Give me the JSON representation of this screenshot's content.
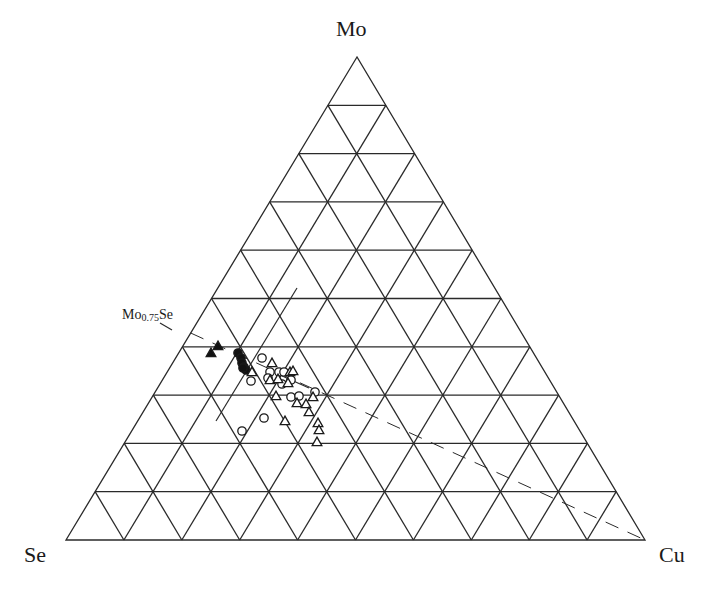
{
  "chart_data": {
    "type": "ternary-scatter",
    "title": "",
    "vertices": {
      "top": "Mo",
      "left": "Se",
      "right": "Cu"
    },
    "grid": {
      "divisions": 10,
      "on": true
    },
    "annotations": [
      {
        "label_main": "Mo",
        "label_sub": "0.75",
        "label_tail": "Se",
        "composition": {
          "Mo": 0.4286,
          "Se": 0.5714,
          "Cu": 0.0
        }
      }
    ],
    "lines": [
      {
        "style": "dashed",
        "from": "Mo0.75Se",
        "to": "Cu",
        "from_px": [
          190.7,
          333.0
        ],
        "to_px": [
          645,
          540
        ]
      },
      {
        "style": "solid",
        "from_px": [
          297,
          288
        ],
        "to_px": [
          216,
          421
        ]
      },
      {
        "style": "solid",
        "from_px": [
          160,
          323
        ],
        "to_px": [
          172,
          330
        ]
      },
      {
        "style": "solid",
        "from_px": [
          280,
          375
        ],
        "to_px": [
          309,
          388
        ]
      }
    ],
    "series": [
      {
        "name": "filled-triangle",
        "marker": "triangle-filled",
        "points_px": [
          [
            218,
            346
          ],
          [
            211,
            353
          ]
        ]
      },
      {
        "name": "filled-circle",
        "marker": "circle-filled",
        "points_px": [
          [
            238,
            353
          ],
          [
            241,
            358
          ],
          [
            242,
            363
          ],
          [
            244,
            367
          ],
          [
            246,
            370
          ],
          [
            243,
            368
          ]
        ]
      },
      {
        "name": "open-circle",
        "marker": "circle-open",
        "points_px": [
          [
            262,
            358
          ],
          [
            270,
            372
          ],
          [
            268,
            378
          ],
          [
            279,
            372
          ],
          [
            284,
            372
          ],
          [
            291,
            380
          ],
          [
            251,
            381
          ],
          [
            282,
            384
          ],
          [
            315,
            392
          ],
          [
            291,
            397
          ],
          [
            299,
            396
          ],
          [
            264,
            418
          ],
          [
            242,
            431
          ]
        ]
      },
      {
        "name": "open-triangle",
        "marker": "triangle-open",
        "points_px": [
          [
            272,
            363
          ],
          [
            252,
            372
          ],
          [
            270,
            380
          ],
          [
            278,
            379
          ],
          [
            290,
            372
          ],
          [
            293,
            371
          ],
          [
            288,
            383
          ],
          [
            276,
            396
          ],
          [
            297,
            403
          ],
          [
            306,
            404
          ],
          [
            313,
            397
          ],
          [
            309,
            412
          ],
          [
            318,
            423
          ],
          [
            319,
            430
          ],
          [
            317,
            442
          ],
          [
            285,
            421
          ]
        ]
      }
    ],
    "axis_vertices_px": {
      "Mo": [
        357,
        57
      ],
      "Se": [
        66,
        540
      ],
      "Cu": [
        645,
        540
      ]
    }
  },
  "labels": {
    "top_vertex": "Mo",
    "left_vertex": "Se",
    "right_vertex": "Cu",
    "phase_main": "Mo",
    "phase_sub": "0.75",
    "phase_tail": "Se"
  }
}
